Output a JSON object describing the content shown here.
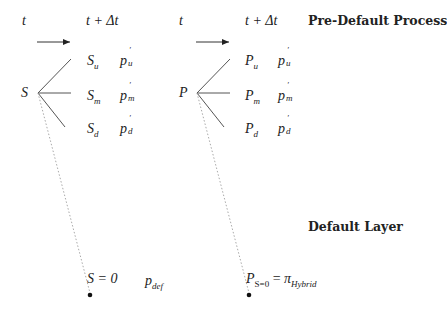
{
  "headers": {
    "left_time_now": "t",
    "left_time_next": "t + Δt",
    "right_time_now": "t",
    "right_time_next": "t + Δt",
    "pre_default_title": "Pre-Default Process",
    "default_layer_title": "Default Layer"
  },
  "left_tree": {
    "root": "S",
    "branches": [
      {
        "state_base": "S",
        "state_sub": "u",
        "prob_base": "p",
        "prob_sup": "′",
        "prob_sub": "u"
      },
      {
        "state_base": "S",
        "state_sub": "m",
        "prob_base": "p",
        "prob_sup": "′",
        "prob_sub": "m"
      },
      {
        "state_base": "S",
        "state_sub": "d",
        "prob_base": "p",
        "prob_sup": "′",
        "prob_sub": "d"
      }
    ],
    "default_state": "S = 0",
    "default_prob_base": "p",
    "default_prob_sub": "def"
  },
  "right_tree": {
    "root": "P",
    "branches": [
      {
        "state_base": "P",
        "state_sub": "u",
        "prob_base": "p",
        "prob_sup": "′",
        "prob_sub": "u"
      },
      {
        "state_base": "P",
        "state_sub": "m",
        "prob_base": "p",
        "prob_sup": "′",
        "prob_sub": "m"
      },
      {
        "state_base": "P",
        "state_sub": "d",
        "prob_base": "p",
        "prob_sup": "′",
        "prob_sub": "d"
      }
    ],
    "default_state_base": "P",
    "default_state_sub": "S=0",
    "default_equals": "=",
    "default_value_base": "π",
    "default_value_sub": "Hybrid"
  },
  "colors": {
    "line": "#444444",
    "dotted": "#999999",
    "text": "#222222"
  }
}
